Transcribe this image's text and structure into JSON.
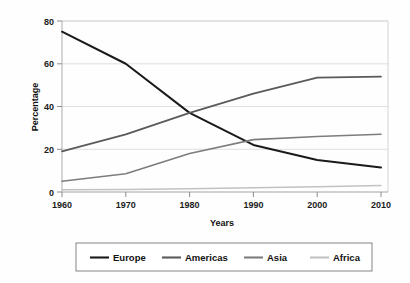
{
  "chart_data": {
    "type": "line",
    "title": "",
    "xlabel": "Years",
    "ylabel": "Percentage",
    "x": [
      1960,
      1970,
      1980,
      1990,
      2000,
      2010
    ],
    "xticklabels": [
      "1960",
      "1970",
      "1980",
      "1990",
      "2000",
      "2010"
    ],
    "yticks": [
      0,
      20,
      40,
      60,
      80
    ],
    "yticklabels": [
      "0",
      "20",
      "40",
      "60",
      "80"
    ],
    "xlim": [
      1960,
      2010
    ],
    "ylim": [
      0,
      80
    ],
    "grid": "horizontal",
    "legend_position": "bottom",
    "series": [
      {
        "name": "Europe",
        "color": "#1a1a1a",
        "width": 2.0,
        "values": [
          75,
          60,
          37,
          22,
          15,
          11.5
        ]
      },
      {
        "name": "Americas",
        "color": "#5a5a5a",
        "width": 1.8,
        "values": [
          19,
          27,
          37,
          46,
          53.5,
          54
        ]
      },
      {
        "name": "Asia",
        "color": "#7d7d7d",
        "width": 1.6,
        "values": [
          5,
          8.5,
          18,
          24.5,
          26,
          27
        ]
      },
      {
        "name": "Africa",
        "color": "#c2c2c2",
        "width": 1.5,
        "values": [
          1,
          1.2,
          1.5,
          2,
          2.5,
          3
        ]
      }
    ]
  },
  "axes": {
    "ylabel": "Percentage",
    "xlabel": "Years"
  },
  "legend": {
    "items": [
      {
        "label": "Europe"
      },
      {
        "label": "Americas"
      },
      {
        "label": "Asia"
      },
      {
        "label": "Africa"
      }
    ]
  }
}
